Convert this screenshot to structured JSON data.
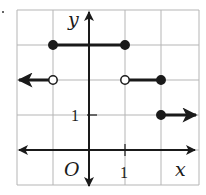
{
  "chart_data": {
    "type": "line",
    "subtype": "step-function",
    "title": "",
    "xlabel": "x",
    "ylabel": "y",
    "origin_label": "O",
    "x_tick_labels": [
      {
        "value": 1,
        "label": "1"
      }
    ],
    "y_tick_labels": [
      {
        "value": 1,
        "label": "1"
      }
    ],
    "xlim": [
      -2,
      3
    ],
    "ylim": [
      -1,
      4
    ],
    "grid": true,
    "grid_step": 1,
    "segments": [
      {
        "x_start": null,
        "x_end": -1,
        "y": 2,
        "start": "arrow-left",
        "end": "open"
      },
      {
        "x_start": -1,
        "x_end": 1,
        "y": 3,
        "start": "closed",
        "end": "closed"
      },
      {
        "x_start": 1,
        "x_end": 2,
        "y": 2,
        "start": "open",
        "end": "closed"
      },
      {
        "x_start": 2,
        "x_end": null,
        "y": 1,
        "start": "closed",
        "end": "arrow-right"
      }
    ],
    "colors": {
      "line": "#1a1a1a",
      "grid": "#b0b0b0",
      "background": "#ffffff"
    }
  }
}
